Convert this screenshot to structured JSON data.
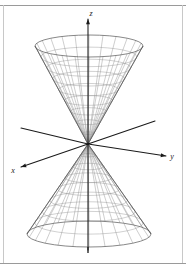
{
  "figure": {
    "background_color": "#ffffff",
    "frame_color": "#9a9a9a",
    "mesh_color": "#8c8c8c",
    "outline_color": "#555555",
    "axis_color": "#1a1a1a"
  },
  "axes": {
    "z": {
      "label": "z",
      "direction": "up",
      "has_arrow": true
    },
    "x": {
      "label": "x",
      "direction": "down-left",
      "has_arrow": true
    },
    "y": {
      "label": "y",
      "direction": "down-right",
      "has_arrow": true
    }
  },
  "chart_data": {
    "type": "line",
    "subtitle": "",
    "xlabel": "x",
    "ylabel": "y",
    "zlabel": "z",
    "surface": "double cone (z^2 = x^2 + y^2)",
    "projection": "oblique 3D wireframe",
    "apex": {
      "x": 88,
      "y": 144
    },
    "upper_cone": {
      "rim_center": {
        "x": 89,
        "y": 46
      },
      "rim_radius_x": 54,
      "rim_radius_y": 11,
      "meridian_count": 24,
      "ring_count": 9
    },
    "lower_cone": {
      "rim_center": {
        "x": 89,
        "y": 234
      },
      "rim_radius_x": 62,
      "rim_radius_y": 13,
      "meridian_count": 24,
      "ring_count": 8
    },
    "axis_endpoints": {
      "z_positive": {
        "x": 88,
        "y": 19
      },
      "z_negative": {
        "x": 88,
        "y": 250
      },
      "x_positive": {
        "x": 21,
        "y": 167
      },
      "x_negative": {
        "x": 155,
        "y": 121
      },
      "y_positive": {
        "x": 166,
        "y": 156
      },
      "y_negative": {
        "x": 21,
        "y": 128
      }
    },
    "grid": false,
    "legend": null,
    "annotations": [
      "z",
      "x",
      "y"
    ]
  }
}
